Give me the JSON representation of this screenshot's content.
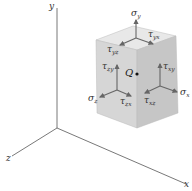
{
  "figure": {
    "axes": {
      "x_label": "x",
      "y_label": "y",
      "z_label": "z"
    },
    "point_label": "Q",
    "stress_labels": {
      "sigma_y": {
        "symbol": "σ",
        "sub": "y"
      },
      "sigma_x": {
        "symbol": "σ",
        "sub": "x"
      },
      "sigma_z": {
        "symbol": "σ",
        "sub": "z"
      },
      "tau_yx": {
        "symbol": "τ",
        "sub": "yx"
      },
      "tau_yz": {
        "symbol": "τ",
        "sub": "yz"
      },
      "tau_zy": {
        "symbol": "τ",
        "sub": "zy"
      },
      "tau_zx": {
        "symbol": "τ",
        "sub": "zx"
      },
      "tau_xy": {
        "symbol": "τ",
        "sub": "xy"
      },
      "tau_xz": {
        "symbol": "τ",
        "sub": "xz"
      }
    },
    "colors": {
      "axis": "#555555",
      "cube_top": "#e6e6e6",
      "cube_front": "#d4d4d4",
      "cube_right": "#c4c4c4",
      "arrow": "#6a6a6a"
    }
  }
}
